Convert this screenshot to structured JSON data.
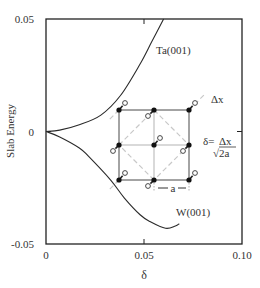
{
  "chart_data": {
    "type": "line",
    "title": "",
    "xlabel": "δ",
    "ylabel": "Slab Energy",
    "xlim": [
      0,
      0.1
    ],
    "ylim": [
      -0.05,
      0.05
    ],
    "grid": false,
    "x_ticks": [
      {
        "value": 0,
        "label": "0"
      },
      {
        "value": 0.05,
        "label": "0.05"
      },
      {
        "value": 0.1,
        "label": "0.10"
      }
    ],
    "y_ticks": [
      {
        "value": 0.05,
        "label": "0.05"
      },
      {
        "value": 0,
        "label": "0"
      },
      {
        "value": -0.05,
        "label": "-0.05"
      }
    ],
    "series": [
      {
        "name": "Ta(001)",
        "x": [
          0,
          0.007,
          0.017,
          0.028,
          0.038,
          0.048,
          0.054,
          0.06
        ],
        "y": [
          0,
          0.0006,
          0.003,
          0.0073,
          0.016,
          0.03,
          0.04,
          0.05
        ]
      },
      {
        "name": "W(001)",
        "x": [
          0,
          0.007,
          0.017,
          0.022,
          0.033,
          0.04,
          0.048,
          0.053,
          0.061,
          0.066,
          0.068
        ],
        "y": [
          0,
          -0.0024,
          -0.0073,
          -0.0113,
          -0.0216,
          -0.0296,
          -0.037,
          -0.04,
          -0.043,
          -0.042,
          -0.041
        ]
      }
    ],
    "annotations": [
      {
        "text": "Ta(001)",
        "near_series": "Ta(001)"
      },
      {
        "text": "W(001)",
        "near_series": "W(001)"
      },
      {
        "text": "Δx",
        "role": "inset-displacement-label"
      },
      {
        "text": "δ=Δx/√2a",
        "role": "inset-formula"
      },
      {
        "text": "a",
        "role": "inset-lattice-spacing"
      }
    ],
    "inset": {
      "description": "square lattice of 3x3 filled atoms (a spacing), open circles displaced diagonally by Δx, dashed diagonals",
      "formula_lhs": "δ=",
      "formula_num": "Δx",
      "formula_den": "√2a",
      "dx_label": "Δx",
      "a_label": "a"
    }
  }
}
